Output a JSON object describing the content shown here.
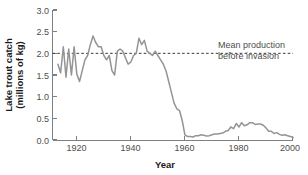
{
  "chart_data": {
    "type": "line",
    "title": "",
    "xlabel": "Year",
    "ylabel": "Lake trout catch (millions of kg)",
    "ylabel_line1": "Lake trout catch",
    "ylabel_line2": "(millions of kg)",
    "xlim": [
      1911,
      2000
    ],
    "ylim": [
      0.0,
      3.0
    ],
    "grid": false,
    "legend": "none",
    "xticks": [
      1920,
      1940,
      1960,
      1980,
      2000
    ],
    "xtick_labels": [
      "1920",
      "1940",
      "1960",
      "1980",
      "2000"
    ],
    "yticks": [
      0.0,
      0.5,
      1.0,
      1.5,
      2.0,
      2.5,
      3.0
    ],
    "ytick_labels": [
      "0.0",
      "0.5",
      "1.0",
      "1.5",
      "2.0",
      "2.5",
      "3.0"
    ],
    "line_color": "#949494",
    "annotations": [
      {
        "name": "mean-production-annotation",
        "line1": "Mean production",
        "line2": "before invasion",
        "value": 2.0,
        "style": "dashed",
        "color": "#3a3a3a"
      }
    ],
    "series": [
      {
        "name": "Lake trout catch",
        "x": [
          1913,
          1914,
          1915,
          1916,
          1917,
          1918,
          1919,
          1920,
          1921,
          1922,
          1923,
          1924,
          1925,
          1926,
          1927,
          1928,
          1929,
          1930,
          1931,
          1932,
          1933,
          1934,
          1935,
          1936,
          1937,
          1938,
          1939,
          1940,
          1941,
          1942,
          1943,
          1944,
          1945,
          1946,
          1947,
          1948,
          1949,
          1950,
          1951,
          1952,
          1953,
          1954,
          1955,
          1956,
          1957,
          1958,
          1959,
          1960,
          1961,
          1962,
          1963,
          1964,
          1965,
          1966,
          1967,
          1968,
          1969,
          1970,
          1971,
          1972,
          1973,
          1974,
          1975,
          1976,
          1977,
          1978,
          1979,
          1980,
          1981,
          1982,
          1983,
          1984,
          1985,
          1986,
          1987,
          1988,
          1989,
          1990,
          1991,
          1992,
          1993,
          1994,
          1995,
          1996,
          1997,
          1998,
          1999,
          2000
        ],
        "y": [
          1.75,
          1.55,
          2.15,
          1.45,
          2.1,
          1.5,
          2.15,
          1.52,
          1.35,
          1.6,
          1.85,
          1.95,
          2.2,
          2.4,
          2.25,
          2.15,
          2.15,
          1.95,
          1.85,
          1.95,
          1.6,
          1.5,
          2.05,
          2.1,
          2.05,
          1.9,
          1.75,
          1.8,
          1.95,
          2.0,
          2.35,
          2.2,
          2.3,
          2.05,
          2.0,
          1.95,
          2.05,
          1.95,
          1.85,
          1.75,
          1.6,
          1.35,
          1.1,
          0.85,
          0.72,
          0.68,
          0.45,
          0.12,
          0.08,
          0.08,
          0.07,
          0.1,
          0.1,
          0.12,
          0.11,
          0.09,
          0.1,
          0.12,
          0.14,
          0.14,
          0.15,
          0.16,
          0.2,
          0.22,
          0.3,
          0.26,
          0.38,
          0.3,
          0.4,
          0.33,
          0.35,
          0.4,
          0.4,
          0.36,
          0.37,
          0.37,
          0.34,
          0.28,
          0.2,
          0.2,
          0.15,
          0.17,
          0.13,
          0.11,
          0.12,
          0.1,
          0.08,
          0.06
        ]
      }
    ]
  }
}
